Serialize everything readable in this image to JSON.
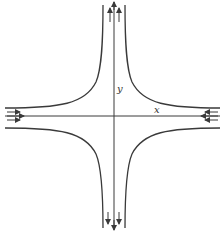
{
  "figure": {
    "type": "stagnation-point flow streamlines",
    "axis_labels": {
      "x": "x",
      "y": "y"
    },
    "colors": {
      "stroke": "#3a3a3a",
      "background": "#ffffff"
    },
    "flow": {
      "x_axis": "inflow from both sides toward origin",
      "y_axis": "outflow away from origin, up and down"
    },
    "streamlines": [
      {
        "quadrant": "upper-left",
        "label": ""
      },
      {
        "quadrant": "upper-right",
        "label": ""
      },
      {
        "quadrant": "lower-left",
        "label": ""
      },
      {
        "quadrant": "lower-right",
        "label": ""
      }
    ]
  }
}
